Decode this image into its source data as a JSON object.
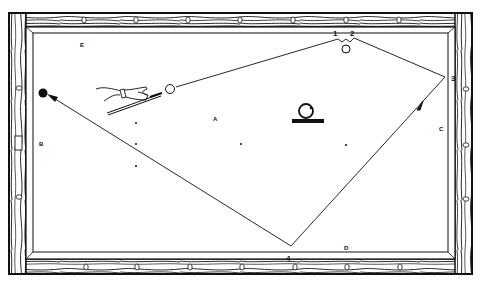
{
  "diagram": {
    "colors": {
      "ink": "#111111",
      "cloth": "#ffffff",
      "wood": "#ffffff"
    },
    "rail_numbers": {
      "one": "1",
      "two": "2",
      "three": "3",
      "four": "4"
    },
    "zone_labels": {
      "a": "A",
      "b": "B",
      "c": "C",
      "d": "D",
      "e": "E"
    },
    "elements": {
      "cue_ball": "cue-ball",
      "object_ball": "object-ball-black",
      "top_ball": "ball-near-rail",
      "ball_on_stand": "ball-on-stand-icon",
      "hand_with_cue": "hand-holding-cue-icon"
    }
  }
}
